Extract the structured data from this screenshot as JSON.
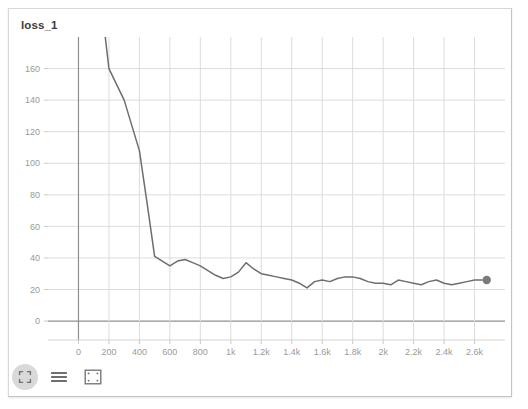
{
  "panel": {
    "title": "loss_1"
  },
  "toolbar": {
    "items": [
      {
        "name": "expand-icon",
        "label": "Expand"
      },
      {
        "name": "list-icon",
        "label": "List"
      },
      {
        "name": "select-region-icon",
        "label": "Select region"
      }
    ]
  },
  "chart_data": {
    "type": "line",
    "title": "loss_1",
    "xlabel": "",
    "ylabel": "",
    "grid": true,
    "legend": false,
    "xlim": [
      -200,
      2800
    ],
    "ylim": [
      -12,
      180
    ],
    "xticks": [
      0,
      200,
      400,
      600,
      800,
      1000,
      1200,
      1400,
      1600,
      1800,
      2000,
      2200,
      2400,
      2600
    ],
    "xticklabels": [
      "0",
      "200",
      "400",
      "600",
      "800",
      "1k",
      "1.2k",
      "1.4k",
      "1.6k",
      "1.8k",
      "2k",
      "2.2k",
      "2.4k",
      "2.6k"
    ],
    "yticks": [
      0,
      20,
      40,
      60,
      80,
      100,
      120,
      140,
      160
    ],
    "yticklabels": [
      "0",
      "20",
      "40",
      "60",
      "80",
      "100",
      "120",
      "140",
      "160"
    ],
    "line_color": "#6e6e6e",
    "marker_color": "#7a7a7a",
    "series": [
      {
        "name": "loss_1",
        "x": [
          170,
          200,
          300,
          400,
          450,
          500,
          550,
          600,
          650,
          700,
          750,
          800,
          850,
          900,
          950,
          1000,
          1050,
          1100,
          1150,
          1200,
          1250,
          1300,
          1350,
          1400,
          1450,
          1500,
          1550,
          1600,
          1650,
          1700,
          1750,
          1800,
          1850,
          1900,
          1950,
          2000,
          2050,
          2100,
          2150,
          2200,
          2250,
          2300,
          2350,
          2400,
          2450,
          2500,
          2550,
          2600,
          2650
        ],
        "values": [
          185,
          160,
          140,
          108,
          75,
          41,
          38,
          35,
          38,
          39,
          37,
          35,
          32,
          29,
          27,
          28,
          31,
          37,
          33,
          30,
          29,
          28,
          27,
          26,
          24,
          21,
          25,
          26,
          25,
          27,
          28,
          28,
          27,
          25,
          24,
          24,
          23,
          26,
          25,
          24,
          23,
          25,
          26,
          24,
          23,
          24,
          25,
          26,
          26
        ]
      }
    ],
    "endpoint": {
      "x": 2680,
      "y": 26
    }
  }
}
